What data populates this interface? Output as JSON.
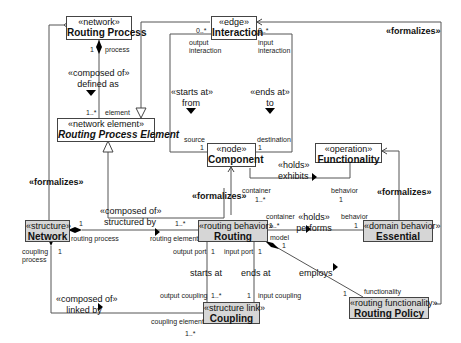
{
  "classes": {
    "routing_process": {
      "stereotype": "«network»",
      "name": "Routing Process"
    },
    "interaction": {
      "stereotype": "«edge»",
      "name": "Interaction"
    },
    "routing_process_element": {
      "stereotype": "«network element»",
      "name": "Routing Process Element"
    },
    "component": {
      "stereotype": "«node»",
      "name": "Component"
    },
    "functionality": {
      "stereotype": "«operation»",
      "name": "Functionality"
    },
    "network": {
      "stereotype": "«structure»",
      "name": "Network"
    },
    "routing": {
      "stereotype": "«routing behavior»",
      "name": "Routing"
    },
    "essential": {
      "stereotype": "«domain behavior»",
      "name": "Essential"
    },
    "coupling": {
      "stereotype": "«structure link»",
      "name": "Coupling"
    },
    "routing_policy": {
      "stereotype": "«routing functionality»",
      "name": "Routing Policy"
    }
  },
  "relations": {
    "rp_composed": {
      "stereotype": "«composed of»",
      "label": "defined as",
      "role_top": "process",
      "mult_top": "1",
      "role_bottom": "element",
      "mult_bottom": "1..*"
    },
    "starts_at": {
      "stereotype": "«starts at»",
      "label": "from",
      "role_top": "output interaction",
      "mult_top": "0..*",
      "role_bottom": "source",
      "mult_bottom": "1"
    },
    "ends_at": {
      "stereotype": "«ends at»",
      "label": "to",
      "role_top": "input interaction",
      "mult_top": "0..*",
      "role_bottom": "destination",
      "mult_bottom": "1"
    },
    "holds_exhibits": {
      "stereotype": "«holds»",
      "label": "exhibits",
      "role_container": "container",
      "mult_container": "1..*",
      "role_behavior": "behavior",
      "mult_behavior": "1"
    },
    "net_composed": {
      "stereotype": "«composed of»",
      "label": "structured by",
      "role_left": "routing process",
      "mult_left": "1",
      "role_right": "routing element",
      "mult_right": "1..*"
    },
    "holds_performs": {
      "stereotype": "«holds»",
      "label": "performs",
      "role_left": "container",
      "mult_left": "1..*",
      "role_right": "behavior",
      "mult_right": "1"
    },
    "routing_starts": {
      "label": "starts at",
      "role_top": "output port",
      "mult_top": "1",
      "role_bottom": "output coupling",
      "mult_bottom": "1..*"
    },
    "routing_ends": {
      "label": "ends at",
      "role_top": "input port",
      "mult_top": "1",
      "role_bottom": "input coupling",
      "mult_bottom": "1"
    },
    "employs": {
      "label": "employs",
      "role_left": "model",
      "mult_left": "1",
      "role_right": "functionality",
      "mult_right": "1"
    },
    "linked": {
      "stereotype": "«composed of»",
      "label": "linked by",
      "role_top": "coupling process",
      "mult_top": "1",
      "role_right": "coupling element",
      "mult_right": "1..*"
    }
  },
  "formalizes": {
    "label": "«formalizes»"
  }
}
